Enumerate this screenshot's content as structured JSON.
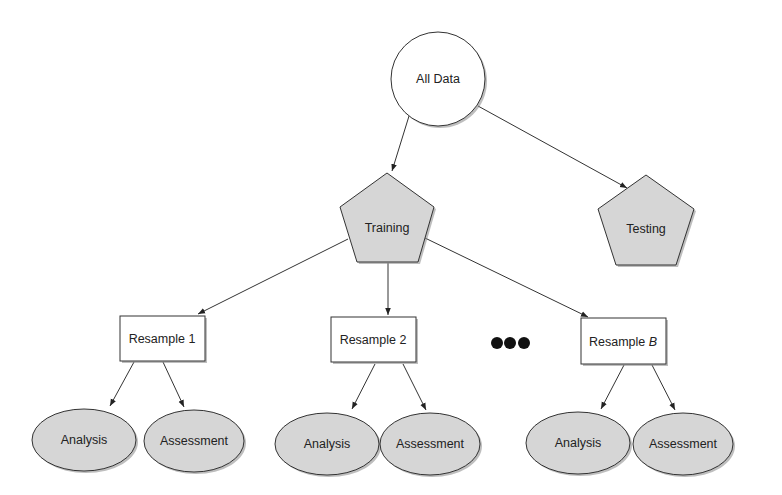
{
  "diagram": {
    "type": "tree",
    "colors": {
      "background": "#ffffff",
      "stroke": "#333333",
      "gray_fill": "#d6d6d6",
      "white_fill": "#ffffff",
      "text": "#222222"
    },
    "nodes": {
      "all_data": {
        "label": "All Data",
        "shape": "circle"
      },
      "training": {
        "label": "Training",
        "shape": "pentagon"
      },
      "testing": {
        "label": "Testing",
        "shape": "pentagon"
      },
      "resample_1": {
        "label": "Resample 1",
        "shape": "rectangle"
      },
      "resample_2": {
        "label": "Resample 2",
        "shape": "rectangle"
      },
      "resample_b": {
        "label_prefix": "Resample ",
        "label_italic": "B",
        "shape": "rectangle"
      },
      "ellipsis": {
        "label": "•••",
        "shape": "dots"
      },
      "analysis_1": {
        "label": "Analysis",
        "shape": "ellipse"
      },
      "assessment_1": {
        "label": "Assessment",
        "shape": "ellipse"
      },
      "analysis_2": {
        "label": "Analysis",
        "shape": "ellipse"
      },
      "assessment_2": {
        "label": "Assessment",
        "shape": "ellipse"
      },
      "analysis_b": {
        "label": "Analysis",
        "shape": "ellipse"
      },
      "assessment_b": {
        "label": "Assessment",
        "shape": "ellipse"
      }
    },
    "edges": [
      {
        "from": "all_data",
        "to": "training"
      },
      {
        "from": "all_data",
        "to": "testing"
      },
      {
        "from": "training",
        "to": "resample_1"
      },
      {
        "from": "training",
        "to": "resample_2"
      },
      {
        "from": "training",
        "to": "resample_b"
      },
      {
        "from": "resample_1",
        "to": "analysis_1"
      },
      {
        "from": "resample_1",
        "to": "assessment_1"
      },
      {
        "from": "resample_2",
        "to": "analysis_2"
      },
      {
        "from": "resample_2",
        "to": "assessment_2"
      },
      {
        "from": "resample_b",
        "to": "analysis_b"
      },
      {
        "from": "resample_b",
        "to": "assessment_b"
      }
    ]
  }
}
